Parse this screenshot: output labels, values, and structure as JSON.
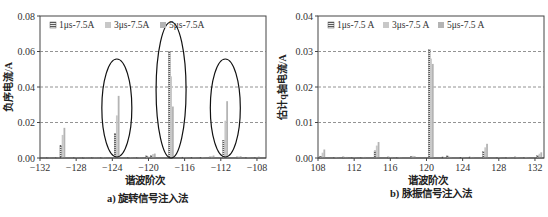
{
  "colors": {
    "series_1": "#7a7a7a",
    "series_2": "#c8c8c8",
    "series_3": "#b4b4b4",
    "grid": "#777777",
    "ellipse": "#111111"
  },
  "chart_data": [
    {
      "type": "bar",
      "title": "a) 旋转信号注入法",
      "xlabel": "谐波阶次",
      "ylabel": "负序电流/A",
      "xlim": [
        -132,
        -107
      ],
      "ylim": [
        0,
        0.08
      ],
      "xticks": [
        "-132",
        "-128",
        "-124",
        "-120",
        "-116",
        "-112",
        "-108"
      ],
      "yticks": [
        "0.00",
        "0.02",
        "0.04",
        "0.06",
        "0.08"
      ],
      "grid": "horizontal dashed",
      "legend": {
        "position": "top-left inside",
        "entries": [
          "1μs-7.5A",
          "3μs-7.5A",
          "5μs-7.5A"
        ]
      },
      "annotations": [
        "ellipse around -123.5 group",
        "ellipse around -117.5 group",
        "ellipse around -111.5 group"
      ],
      "x": [
        -131,
        -130,
        -129.5,
        -128,
        -127,
        -126,
        -125,
        -123.5,
        -122,
        -121,
        -120,
        -119.5,
        -117.5,
        -116,
        -115,
        -114,
        -113,
        -111.5,
        -110,
        -109,
        -108
      ],
      "series": [
        {
          "name": "1μs-7.5A",
          "values": [
            0.0003,
            0.0004,
            0.007,
            0.0003,
            0.0002,
            0.0003,
            0.0004,
            0.014,
            0.0003,
            0.0004,
            0.0012,
            0.0015,
            0.06,
            0.0005,
            0.0003,
            0.0004,
            0.0006,
            0.01,
            0.0006,
            0.0003,
            0.0004
          ]
        },
        {
          "name": "3μs-7.5A",
          "values": [
            0.0002,
            0.0003,
            0.013,
            0.0004,
            0.0003,
            0.0002,
            0.0005,
            0.024,
            0.0004,
            0.0003,
            0.0008,
            0.0022,
            0.046,
            0.0004,
            0.0003,
            0.0005,
            0.001,
            0.021,
            0.0008,
            0.0004,
            0.0006
          ]
        },
        {
          "name": "5μs-7.5A",
          "values": [
            0.0002,
            0.0005,
            0.017,
            0.0003,
            0.0002,
            0.0003,
            0.0004,
            0.035,
            0.0003,
            0.0004,
            0.0006,
            0.0025,
            0.029,
            0.0006,
            0.0004,
            0.0003,
            0.0014,
            0.032,
            0.001,
            0.0005,
            0.0008
          ]
        }
      ]
    },
    {
      "type": "bar",
      "title": "b) 脉振信号注入法",
      "xlabel": "谐波阶次",
      "ylabel": "估计q轴电流/A",
      "xlim": [
        108,
        133
      ],
      "ylim": [
        0,
        0.04
      ],
      "xticks": [
        "108",
        "112",
        "116",
        "120",
        "124",
        "128",
        "132"
      ],
      "yticks": [
        "0.00",
        "0.01",
        "0.02",
        "0.03",
        "0.04"
      ],
      "grid": "horizontal dashed",
      "legend": {
        "position": "top-left inside",
        "entries": [
          "1μs-7.5 A",
          "3μs-7.5 A",
          "5μs-7.5 A"
        ]
      },
      "x": [
        108.5,
        110,
        111,
        112,
        113,
        114.5,
        116,
        117,
        118.5,
        120.5,
        122,
        122.5,
        124,
        125,
        126.5,
        128,
        129,
        130,
        131,
        132.5
      ],
      "series": [
        {
          "name": "1μs-7.5 A",
          "values": [
            0.0005,
            0.0002,
            0.0003,
            0.0002,
            0.0002,
            0.002,
            0.0003,
            0.0002,
            0.0004,
            0.0305,
            0.0003,
            0.0006,
            0.0002,
            0.0003,
            0.0018,
            0.0002,
            0.0002,
            0.0003,
            0.0002,
            0.0008
          ]
        },
        {
          "name": "3μs-7.5 A",
          "values": [
            0.0015,
            0.0003,
            0.0002,
            0.0003,
            0.0002,
            0.0035,
            0.0002,
            0.0003,
            0.0006,
            0.028,
            0.0002,
            0.0004,
            0.0003,
            0.0002,
            0.003,
            0.0003,
            0.0002,
            0.0002,
            0.0003,
            0.0012
          ]
        },
        {
          "name": "5μs-7.5 A",
          "values": [
            0.0024,
            0.0002,
            0.0003,
            0.0002,
            0.0003,
            0.0045,
            0.0003,
            0.0002,
            0.0005,
            0.0265,
            0.0003,
            0.0003,
            0.0002,
            0.0003,
            0.004,
            0.0002,
            0.0003,
            0.0002,
            0.0002,
            0.0016
          ]
        }
      ]
    }
  ],
  "panels": {
    "left": {
      "caption": "a) 旋转信号注入法",
      "xlabel": "谐波阶次",
      "ylabel": "负序电流/A",
      "legend": [
        "1μs-7.5A",
        "3μs-7.5A",
        "5μs-7.5A"
      ]
    },
    "right": {
      "caption": "b) 脉振信号注入法",
      "xlabel": "谐波阶次",
      "ylabel": "估计q轴电流/A",
      "legend": [
        "1μs-7.5 A",
        "3μs-7.5 A",
        "5μs-7.5 A"
      ]
    }
  }
}
